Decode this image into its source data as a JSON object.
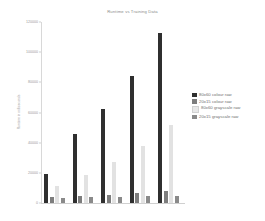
{
  "chart_data": {
    "type": "bar",
    "title": "Runtime vs Training Data",
    "xlabel": "",
    "ylabel": "Runtime in milliseconds",
    "categories": [
      "1",
      "2",
      "3",
      "4",
      "5"
    ],
    "ylim": [
      0,
      120000
    ],
    "yticks": [
      0,
      20000,
      40000,
      60000,
      80000,
      100000,
      120000
    ],
    "ytick_labels": [
      "0",
      "20000",
      "40000",
      "60000",
      "80000",
      "100000",
      "120000"
    ],
    "grid": false,
    "legend_position": "right",
    "series": [
      {
        "name": "80x60 colour raw",
        "color": "#2f2f2f",
        "values": [
          19000,
          46000,
          62000,
          84000,
          113000
        ]
      },
      {
        "name": "20x15 colour raw",
        "color": "#7d7d7d",
        "values": [
          4200,
          4600,
          5600,
          6600,
          8200
        ]
      },
      {
        "name": "80x60 grayscale raw",
        "color": "#e2e2e2",
        "values": [
          11000,
          18500,
          27500,
          38000,
          52000
        ]
      },
      {
        "name": "20x15 grayscale raw",
        "color": "#8a8a8a",
        "values": [
          3600,
          3900,
          4100,
          4400,
          4600
        ]
      }
    ]
  },
  "legend": {
    "items": [
      {
        "label": "80x60 colour raw",
        "swatch": "#2f2f2f"
      },
      {
        "label": "20x15 colour raw",
        "swatch": "#7d7d7d"
      },
      {
        "label": "80x60 grayscale raw",
        "swatch": "#e8e8e8"
      },
      {
        "label": "20x15 grayscale raw",
        "swatch": "#8a8a8a"
      }
    ]
  }
}
